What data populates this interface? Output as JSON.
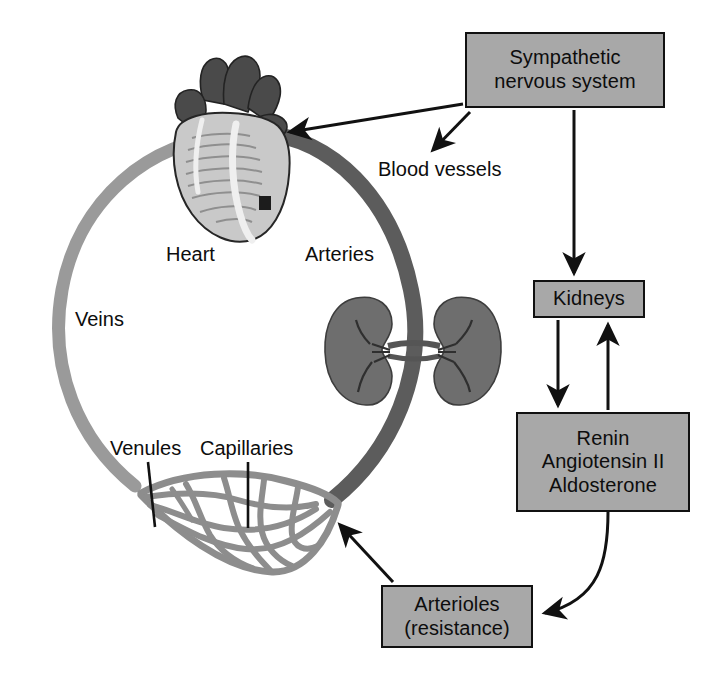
{
  "figure": {
    "background_color": "#ffffff"
  },
  "palette": {
    "box_fill": "#a8a8a8",
    "box_border": "#111111",
    "text": "#0d0d0d",
    "artery_gray": "#5c5c5c",
    "vein_gray": "#9a9a9a",
    "capillary_gray": "#8d8d8d",
    "kidney_gray": "#6e6e6e",
    "heart_dark": "#4a4a4a",
    "heart_light": "#c9c9c9",
    "arrow_black": "#111111"
  },
  "boxes": [
    {
      "id": "sympathetic",
      "lines": [
        "Sympathetic",
        "nervous system"
      ],
      "line1": "Sympathetic",
      "line2": "nervous system"
    },
    {
      "id": "kidneys",
      "line1": "Kidneys"
    },
    {
      "id": "renin",
      "line1": "Renin",
      "line2": "Angiotensin II",
      "line3": "Aldosterone"
    },
    {
      "id": "arterioles",
      "line1": "Arterioles",
      "line2": "(resistance)"
    }
  ],
  "labels": {
    "blood_vessels": "Blood vessels",
    "heart": "Heart",
    "arteries": "Arteries",
    "veins": "Veins",
    "venules": "Venules",
    "capillaries": "Capillaries"
  },
  "illustrations": [
    {
      "id": "heart-illustration",
      "name": "heart",
      "label": "Heart"
    },
    {
      "id": "kidneys-illustration",
      "name": "kidneys",
      "label": "Kidneys"
    },
    {
      "id": "capillary-bed-illustration",
      "name": "capillary bed",
      "label": "Capillaries"
    },
    {
      "id": "circulation-loop",
      "name": "systemic circulation loop",
      "label": "Arteries / Veins"
    }
  ],
  "connections": [
    {
      "from": "Sympathetic nervous system",
      "to": "Heart",
      "style": "straight-arrow"
    },
    {
      "from": "Sympathetic nervous system",
      "to": "Blood vessels",
      "style": "straight-arrow"
    },
    {
      "from": "Sympathetic nervous system",
      "to": "Kidneys",
      "style": "straight-arrow"
    },
    {
      "from": "Kidneys",
      "to": "Renin Angiotensin II Aldosterone",
      "style": "straight-arrow"
    },
    {
      "from": "Renin Angiotensin II Aldosterone",
      "to": "Kidneys",
      "style": "straight-arrow"
    },
    {
      "from": "Renin Angiotensin II Aldosterone",
      "to": "Arterioles (resistance)",
      "style": "curved-arrow"
    },
    {
      "from": "Arterioles (resistance)",
      "to": "Capillaries",
      "style": "straight-arrow"
    }
  ]
}
